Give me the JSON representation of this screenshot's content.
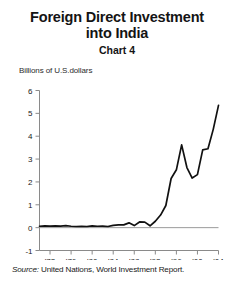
{
  "figure": {
    "title_lines": [
      "Foreign Direct Investment",
      "into India"
    ],
    "chart_number": "Chart 4",
    "unit_label": "Billions of U.S.dollars",
    "source_prefix": "Source:",
    "source_text": "United Nations, World Investment Report."
  },
  "chart_data": {
    "type": "line",
    "title": "Foreign Direct Investment into India",
    "subtitle": "Chart 4",
    "xlabel": "",
    "ylabel": "Billions of U.S.dollars",
    "xlim": [
      1970,
      2004
    ],
    "ylim": [
      -1,
      6
    ],
    "yticks": [
      -1,
      0,
      1,
      2,
      3,
      4,
      5,
      6
    ],
    "ytick_labels": [
      "-1",
      "0",
      "1",
      "2",
      "3",
      "4",
      "5",
      "6"
    ],
    "xticks": [
      1972,
      1976,
      1980,
      1984,
      1988,
      1992,
      1996,
      2000,
      2004
    ],
    "xtick_labels": [
      "'72",
      "'76",
      "'80",
      "'84",
      "'88",
      "'92",
      "'96",
      "'00",
      "'04"
    ],
    "grid": false,
    "legend": false,
    "zero_line": 0,
    "line_color": "#111111",
    "series": [
      {
        "name": "Foreign direct investment into India",
        "x": [
          1970,
          1971,
          1972,
          1973,
          1974,
          1975,
          1976,
          1977,
          1978,
          1979,
          1980,
          1981,
          1982,
          1983,
          1984,
          1985,
          1986,
          1987,
          1988,
          1989,
          1990,
          1991,
          1992,
          1993,
          1994,
          1995,
          1996,
          1997,
          1998,
          1999,
          2000,
          2001,
          2002,
          2003,
          2004
        ],
        "values": [
          0.06,
          0.08,
          0.07,
          0.08,
          0.07,
          0.09,
          0.06,
          0.05,
          0.06,
          0.05,
          0.08,
          0.06,
          0.07,
          0.05,
          0.1,
          0.12,
          0.12,
          0.21,
          0.09,
          0.25,
          0.24,
          0.08,
          0.28,
          0.55,
          0.97,
          2.15,
          2.53,
          3.62,
          2.63,
          2.17,
          2.32,
          3.4,
          3.45,
          4.3,
          5.35
        ]
      }
    ]
  }
}
